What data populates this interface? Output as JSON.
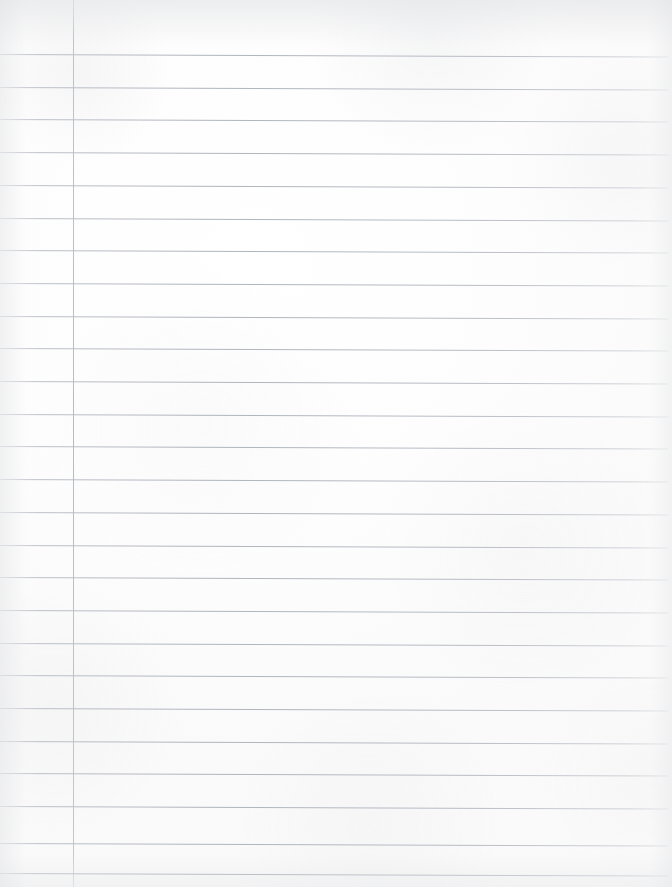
{
  "document": {
    "kind": "scanned-notebook-page",
    "title": "Blank Lined Notebook Page",
    "description": "A blank, college-ruled sheet of lined notebook paper, scanned. No handwriting or printed text is present.",
    "page_width": 672,
    "page_height": 887,
    "orientation": "portrait",
    "text_content": "",
    "visible_text_present": false
  },
  "paper": {
    "background_color": "#fdfdfd",
    "tint_color": "#fafafa",
    "edge_shadow_color": "#dddee1",
    "texture": "faint scanner grain and soft mottling"
  },
  "ruling": {
    "style": "college-ruled",
    "horizontal": {
      "color": "#b9bdc4",
      "thickness_px": 1,
      "count": 26,
      "first_line_y": 54,
      "spacing_px": 32.7,
      "start_x": 0,
      "end_x": 668,
      "skew_deg": 0.22,
      "y_positions": [
        54,
        86.7,
        119.4,
        152.1,
        184.8,
        217.5,
        250.2,
        282.9,
        315.6,
        348.3,
        381.0,
        413.7,
        446.4,
        479.1,
        511.8,
        544.5,
        577.2,
        609.9,
        642.6,
        675.3,
        708.0,
        740.7,
        773.4,
        806.1,
        843.0,
        873.0
      ]
    },
    "vertical_margin": {
      "label": "margin-rule",
      "color": "#c2c6cc",
      "thickness_px": 1,
      "x": 73,
      "top_y": 0,
      "bottom_y": 887
    }
  },
  "annotations": {
    "handwriting": [],
    "printed_text": [],
    "holes": [],
    "stains": []
  }
}
